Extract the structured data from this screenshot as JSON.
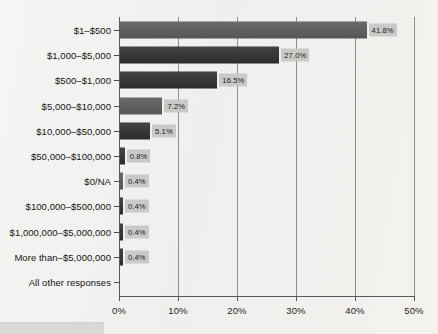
{
  "chart_data": {
    "type": "bar",
    "orientation": "horizontal",
    "title": "",
    "xlabel": "",
    "ylabel": "",
    "xlim": [
      0,
      50
    ],
    "grid": true,
    "legend": false,
    "xtick_labels": [
      "0%",
      "10%",
      "20%",
      "30%",
      "40%",
      "50%"
    ],
    "xtick_values": [
      0,
      10,
      20,
      30,
      40,
      50
    ],
    "categories": [
      "$1–$500",
      "$1,000–$5,000",
      "$500–$1,000",
      "$5,000–$10,000",
      "$10,000–$50,000",
      "$50,000–$100,000",
      "$0/NA",
      "$100,000–$500,000",
      "$1,000,000–$5,000,000",
      "More than–$5,000,000",
      "All other responses"
    ],
    "values": [
      41.8,
      27.0,
      16.5,
      7.2,
      5.1,
      0.8,
      0.4,
      0.4,
      0.4,
      0.4,
      null
    ],
    "data_labels": [
      "41.8%",
      "27.0%",
      "16.5%",
      "7.2%",
      "5.1%",
      "0.8%",
      "0.4%",
      "0.4%",
      "0.4%",
      "0.4%",
      ""
    ],
    "bar_tones": [
      "a",
      "b",
      "b",
      "a",
      "b",
      "b",
      "a",
      "b",
      "b",
      "b",
      "a"
    ],
    "colors": {
      "bar_light": "#5a5a5a",
      "bar_dark": "#2e2e2e",
      "label_box": "#c9c9c7",
      "axis": "#5a5a5a",
      "gridline": "#8e8e8e",
      "background": "#f2f2f0",
      "text": "#141414"
    }
  }
}
